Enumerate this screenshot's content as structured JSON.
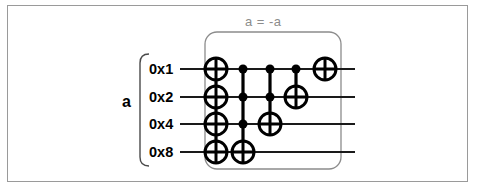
{
  "figure": {
    "title": "a = -a",
    "register_label": "a",
    "border_color": "#9a9a9a",
    "wire_color": "#1a1a1a",
    "gate_color": "#000000",
    "bracket_color": "#8c8c8c",
    "label_color": "#8c8c8c",
    "background": "#ffffff"
  },
  "wires": [
    {
      "label": "0x1",
      "y": 69
    },
    {
      "label": "0x2",
      "y": 97
    },
    {
      "label": "0x4",
      "y": 124
    },
    {
      "label": "0x8",
      "y": 152
    }
  ],
  "columns": [
    {
      "x": 216,
      "name": "column-1-not-all",
      "targets": [
        0,
        1,
        2,
        3
      ],
      "controls": []
    },
    {
      "x": 243,
      "name": "column-2-toffoli-0x8",
      "targets": [
        3
      ],
      "controls": [
        0,
        1,
        2
      ]
    },
    {
      "x": 270,
      "name": "column-3-toffoli-0x4",
      "targets": [
        2
      ],
      "controls": [
        0,
        1
      ]
    },
    {
      "x": 296,
      "name": "column-4-cnot-0x2",
      "targets": [
        1
      ],
      "controls": [
        0
      ]
    },
    {
      "x": 325,
      "name": "column-5-not-0x1",
      "targets": [
        0
      ],
      "controls": []
    }
  ],
  "geometry": {
    "wire_start_x": 180,
    "wire_end_x": 355,
    "gate_radius": 11,
    "control_radius": 4.5,
    "bracket": {
      "x": 205,
      "y": 32,
      "width": 136,
      "height": 137,
      "radius": 12
    },
    "brace": {
      "x": 140,
      "y": 54,
      "height": 112
    },
    "title_pos": {
      "x": 245,
      "y": 14
    },
    "register_label_pos": {
      "x": 122,
      "y": 102
    },
    "wire_label_x": 149
  }
}
